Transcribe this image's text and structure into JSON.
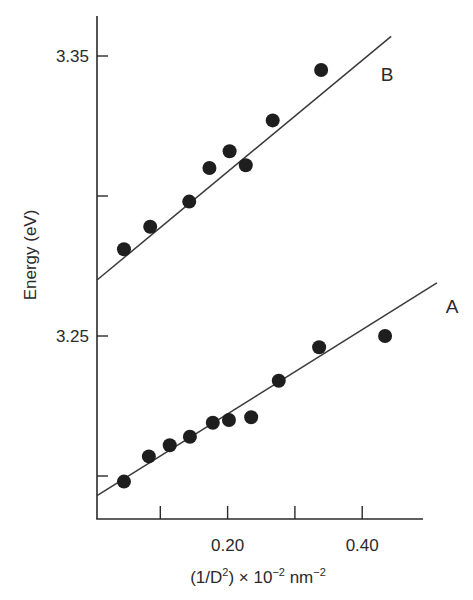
{
  "chart_data": {
    "type": "scatter",
    "title": "",
    "xlabel": "(1/D²) × 10⁻² nm⁻²",
    "xlabel_parts": {
      "pre": "(1/D",
      "sup1": "2",
      "mid": ") × 10",
      "sup2": "−2",
      "unit": " nm",
      "sup3": "−2"
    },
    "ylabel": "Energy (eV)",
    "xlim": [
      0.0,
      0.49
    ],
    "ylim": [
      3.185,
      3.365
    ],
    "x_ticks": [
      0.1,
      0.2,
      0.3,
      0.4
    ],
    "x_tick_labels": [
      "",
      "0.20",
      "",
      "0.40"
    ],
    "y_ticks": [
      3.2,
      3.25,
      3.3,
      3.35
    ],
    "y_tick_labels": [
      "",
      "3.25",
      "",
      "3.35"
    ],
    "grid": false,
    "legend": "none (series labeled inline)",
    "series": [
      {
        "name": "B",
        "label": "B",
        "points": [
          {
            "x": 0.046,
            "y": 3.281
          },
          {
            "x": 0.085,
            "y": 3.289
          },
          {
            "x": 0.143,
            "y": 3.298
          },
          {
            "x": 0.173,
            "y": 3.31
          },
          {
            "x": 0.203,
            "y": 3.316
          },
          {
            "x": 0.227,
            "y": 3.311
          },
          {
            "x": 0.267,
            "y": 3.327
          },
          {
            "x": 0.339,
            "y": 3.345
          }
        ],
        "fit_line": {
          "x0": 0.006,
          "y0": 3.27,
          "x1": 0.443,
          "y1": 3.357
        }
      },
      {
        "name": "A",
        "label": "A",
        "points": [
          {
            "x": 0.046,
            "y": 3.198
          },
          {
            "x": 0.083,
            "y": 3.207
          },
          {
            "x": 0.114,
            "y": 3.211
          },
          {
            "x": 0.144,
            "y": 3.214
          },
          {
            "x": 0.178,
            "y": 3.219
          },
          {
            "x": 0.202,
            "y": 3.22
          },
          {
            "x": 0.235,
            "y": 3.221
          },
          {
            "x": 0.276,
            "y": 3.234
          },
          {
            "x": 0.336,
            "y": 3.246
          },
          {
            "x": 0.434,
            "y": 3.25
          }
        ],
        "fit_line": {
          "x0": 0.006,
          "y0": 3.193,
          "x1": 0.511,
          "y1": 3.269
        }
      }
    ]
  },
  "colors": {
    "ink": "#2a2a2a",
    "marker": "#1e1e1e",
    "line": "#3a3a3a",
    "background": "#ffffff"
  }
}
